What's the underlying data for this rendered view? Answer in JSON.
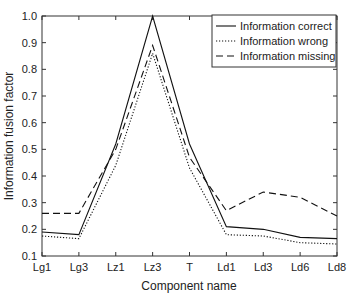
{
  "chart_data": {
    "type": "line",
    "title": "",
    "xlabel": "Component name",
    "ylabel": "Information fusion factor",
    "categories": [
      "Lg1",
      "Lg3",
      "Lz1",
      "Lz3",
      "T",
      "Ld1",
      "Ld3",
      "Ld6",
      "Ld8"
    ],
    "ylim": [
      0.1,
      1.0
    ],
    "yticks": [
      "0.1",
      "0.2",
      "0.3",
      "0.4",
      "0.5",
      "0.6",
      "0.7",
      "0.8",
      "0.9",
      "1.0"
    ],
    "grid": false,
    "legend_position": "upper right",
    "series": [
      {
        "name": "Information correct",
        "style": "solid",
        "values": [
          0.19,
          0.18,
          0.52,
          1.0,
          0.52,
          0.21,
          0.2,
          0.17,
          0.165
        ]
      },
      {
        "name": "Information wrong",
        "style": "dotted",
        "values": [
          0.175,
          0.165,
          0.44,
          0.86,
          0.43,
          0.18,
          0.175,
          0.15,
          0.145
        ]
      },
      {
        "name": "Information missing",
        "style": "dashed",
        "values": [
          0.26,
          0.26,
          0.5,
          0.89,
          0.47,
          0.27,
          0.34,
          0.32,
          0.25
        ]
      }
    ]
  }
}
